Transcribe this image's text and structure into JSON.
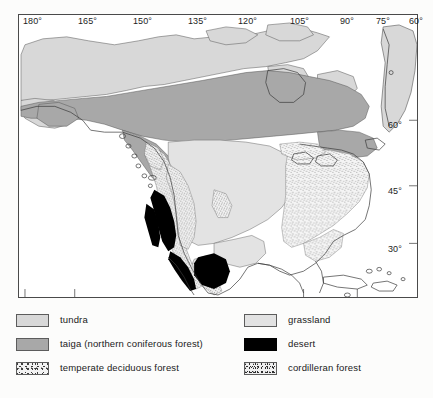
{
  "figure": {
    "kind": "thematic-biome-map",
    "region": "North America",
    "background_color": "#fcfcfb"
  },
  "map": {
    "frame_color": "#4a4a4a",
    "ocean_color": "#ffffff",
    "coastline_color": "#3a3a3a",
    "longitude_labels": [
      {
        "text": "180°",
        "x": 23,
        "tick_x": 20
      },
      {
        "text": "165°",
        "x": 78,
        "tick_x": 75
      },
      {
        "text": "150°",
        "x": 133,
        "tick_x": 130
      },
      {
        "text": "135°",
        "x": 188,
        "tick_x": 185
      },
      {
        "text": "120°",
        "x": 238,
        "tick_x": 238
      },
      {
        "text": "105°",
        "x": 290,
        "tick_x": 290
      },
      {
        "text": "90°",
        "x": 340,
        "tick_x": 340
      },
      {
        "text": "75°",
        "x": 376,
        "tick_x": 376
      },
      {
        "text": "60°",
        "x": 409,
        "tick_x": 409
      }
    ],
    "latitude_labels": [
      {
        "text": "60°",
        "y": 120
      },
      {
        "text": "45°",
        "y": 186
      },
      {
        "text": "30°",
        "y": 244
      }
    ]
  },
  "legend": {
    "columns": [
      {
        "name": "left",
        "entries": [
          {
            "label": "tundra",
            "swatch": "tundra",
            "color": "#d8d8d8"
          },
          {
            "label": "taiga (northern coniferous forest)",
            "swatch": "taiga",
            "color": "#a8a8a8"
          },
          {
            "label": "temperate deciduous forest",
            "swatch": "decid",
            "color": "#f2f2f2"
          }
        ]
      },
      {
        "name": "right",
        "entries": [
          {
            "label": "grassland",
            "swatch": "grassland",
            "color": "#e2e2e2"
          },
          {
            "label": "desert",
            "swatch": "desert",
            "color": "#000000"
          },
          {
            "label": "cordilleran forest",
            "swatch": "cordil",
            "color": "#efefef"
          }
        ]
      }
    ]
  }
}
